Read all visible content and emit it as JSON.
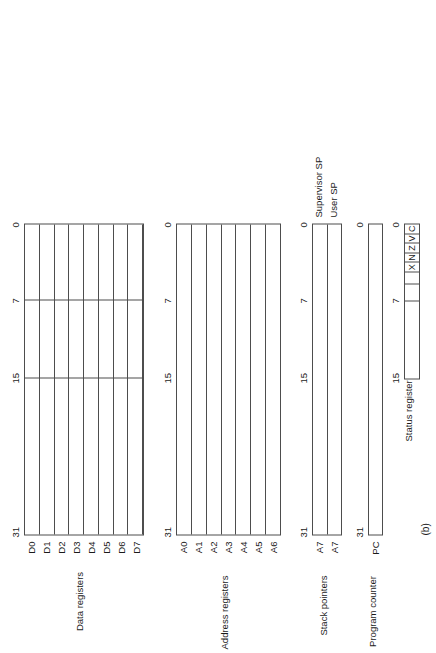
{
  "figure": {
    "caption": "(b)",
    "bit_ticks": [
      "31",
      "15",
      "7",
      "0"
    ],
    "groups": [
      {
        "id": "data-registers",
        "caption": "Data registers",
        "rows": [
          "D0",
          "D1",
          "D2",
          "D3",
          "D4",
          "D5",
          "D6",
          "D7"
        ],
        "ticks": [
          "31",
          "15",
          "7",
          "0"
        ],
        "inner_rules": [
          "15",
          "7"
        ],
        "side_labels": []
      },
      {
        "id": "address-registers",
        "caption": "Address registers",
        "rows": [
          "A0",
          "A1",
          "A2",
          "A3",
          "A4",
          "A5",
          "A6"
        ],
        "ticks": [
          "31",
          "15",
          "7",
          "0"
        ],
        "inner_rules": [],
        "side_labels": []
      },
      {
        "id": "stack-pointers",
        "caption": "Stack pointers",
        "rows": [
          "A7",
          "A7"
        ],
        "ticks": [
          "31",
          "15",
          "7",
          "0"
        ],
        "inner_rules": [],
        "side_labels": [
          "Supervisor SP",
          "User SP"
        ]
      },
      {
        "id": "program-counter",
        "caption": "Program counter",
        "rows": [
          "PC"
        ],
        "ticks": [
          "31",
          "0"
        ],
        "inner_rules": [],
        "side_labels": []
      }
    ],
    "status_register": {
      "id": "status-register",
      "caption": "Status register",
      "ticks": [
        "15",
        "7",
        "0"
      ],
      "cells": [
        "",
        "",
        "",
        "X",
        "N",
        "Z",
        "V",
        "C"
      ]
    }
  },
  "colors": {
    "line": "#4d4d4d",
    "text": "#1a1a1a",
    "background": "#ffffff"
  }
}
